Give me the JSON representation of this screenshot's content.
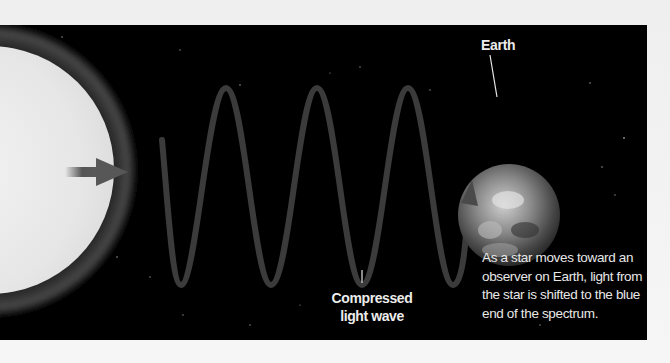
{
  "diagram": {
    "labels": {
      "earth": "Earth",
      "wave_line1": "Compressed",
      "wave_line2": "light wave"
    },
    "caption": "As a star moves toward an observer on Earth, light from the star is shifted to the blue end of the spectrum.",
    "elements": {
      "star": "star-sphere",
      "motion_arrow": "arrow-right-icon",
      "wave": "compressed-light-wave",
      "planet": "earth-globe"
    },
    "wave": {
      "crests": 3,
      "troughs": 4,
      "direction": "toward Earth"
    },
    "colors": {
      "background": "#000000",
      "page": "#f4f4f4",
      "star_fill": "#e9e9e9",
      "star_rim": "#3c3c3c",
      "wave": "#3a3a3a",
      "arrow": "#555555",
      "text": "#ececec"
    }
  }
}
